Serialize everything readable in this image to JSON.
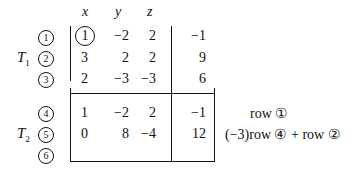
{
  "headers": [
    "x",
    "y",
    "z"
  ],
  "tableaux": [
    {
      "label": "T",
      "subscript": "1",
      "rows": [
        {
          "index": "1",
          "values": [
            "1",
            "−2",
            "2"
          ],
          "rhs": "−1",
          "pivot": true,
          "note": ""
        },
        {
          "index": "2",
          "values": [
            "3",
            "2",
            "2"
          ],
          "rhs": "9",
          "note": ""
        },
        {
          "index": "3",
          "values": [
            "2",
            "−3",
            "−3"
          ],
          "rhs": "6",
          "note": ""
        }
      ]
    },
    {
      "label": "T",
      "subscript": "2",
      "rows": [
        {
          "index": "4",
          "values": [
            "1",
            "−2",
            "2"
          ],
          "rhs": "−1",
          "note": "row ①"
        },
        {
          "index": "5",
          "values": [
            "0",
            "8",
            "−4"
          ],
          "rhs": "12",
          "note": "(−3)row ④ + row ②"
        },
        {
          "index": "6",
          "values": [
            "",
            "",
            ""
          ],
          "rhs": "",
          "note": ""
        }
      ]
    }
  ]
}
